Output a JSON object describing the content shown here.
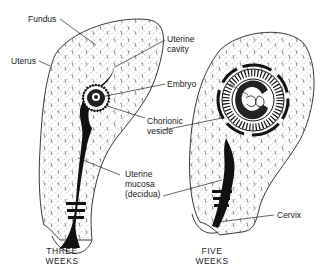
{
  "labels": {
    "fundus": "Fundus",
    "uterus": "Uterus",
    "uterine_cavity": "Uterine\ncavity",
    "embryo": "Embryo",
    "chorionic_vesicle": "Chorionic\nvesicle",
    "uterine_mucosa": "Uterine\nmucosa\n(decidua)",
    "cervix": "Cervix"
  },
  "captions": {
    "three_weeks": "THREE\nWEEKS",
    "five_weeks": "FIVE\nWEEKS"
  },
  "colors": {
    "ink": "#1a1a1a",
    "background": "#ffffff"
  }
}
